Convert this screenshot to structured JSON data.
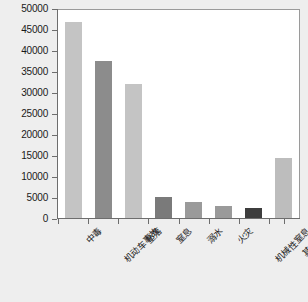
{
  "chart_data": {
    "type": "bar",
    "title": "",
    "subtitle": "",
    "xlabel": "",
    "ylabel": "",
    "categories": [
      "中毒",
      "机动车事故",
      "坠落",
      "窒息",
      "溺水",
      "火灾",
      "机械性窒息",
      "其他事件"
    ],
    "values": [
      47200,
      37800,
      32200,
      5100,
      3900,
      3000,
      2300,
      14500
    ],
    "bar_colors": [
      "#c4c4c4",
      "#8c8c8c",
      "#c4c4c4",
      "#7a7a7a",
      "#9a9a9a",
      "#9a9a9a",
      "#3d3d3d",
      "#bdbdbd"
    ],
    "ylim": [
      0,
      50000
    ],
    "ytick_step": 5000,
    "yticks": [
      0,
      5000,
      10000,
      15000,
      20000,
      25000,
      30000,
      35000,
      40000,
      45000,
      50000
    ],
    "ytick_labels": [
      "0",
      "5000",
      "10000",
      "15000",
      "20000",
      "25000",
      "30000",
      "35000",
      "40000",
      "45000",
      "50000"
    ],
    "grid": false,
    "legend": "none",
    "xtick_rotation": -45,
    "plot_background": "#ffffff",
    "figure_background": "#eeeeee",
    "axis_color": "#6d6d6d",
    "frame_color": "#9a9a9a"
  }
}
